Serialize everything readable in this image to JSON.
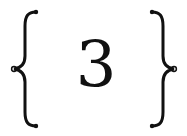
{
  "expression": {
    "left_delimiter": "{",
    "content": "3",
    "right_delimiter": "}",
    "latex": "\\left\\{ 3 \\right\\}"
  },
  "colors": {
    "ink": "#111111",
    "background": "#ffffff"
  }
}
